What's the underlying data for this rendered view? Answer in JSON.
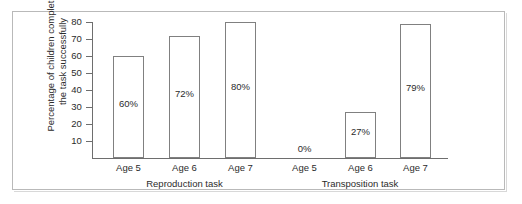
{
  "chart_data": {
    "type": "bar",
    "title": "",
    "xlabel": "",
    "ylabel": "Percentage of children completing the task successfully",
    "ylabel_lines": [
      "Percentage of children completing",
      "the task successfully"
    ],
    "ylim": [
      0,
      85
    ],
    "yticks": [
      10,
      20,
      30,
      40,
      50,
      60,
      70,
      80
    ],
    "ytick_labels": [
      "10",
      "20",
      "30",
      "40",
      "50",
      "60",
      "70",
      "80"
    ],
    "grid": false,
    "legend": "none",
    "groups": [
      {
        "name": "Reproduction task",
        "categories": [
          "Age 5",
          "Age 6",
          "Age 7"
        ],
        "values": [
          60,
          72,
          80
        ],
        "value_labels": [
          "60%",
          "72%",
          "80%"
        ]
      },
      {
        "name": "Transposition task",
        "categories": [
          "Age 5",
          "Age 6",
          "Age 7"
        ],
        "values": [
          0,
          27,
          79
        ],
        "value_labels": [
          "0%",
          "27%",
          "79%"
        ]
      }
    ],
    "colors": {
      "bar_fill": "#ffffff",
      "bar_stroke": "#808080",
      "axis": "#6e6e6e",
      "text": "#2b2b2b",
      "frame": "#b9b9b9",
      "background": "#ffffff"
    }
  },
  "bars": [
    {
      "label": "60%",
      "category": "Age 5",
      "group": "Reproduction task",
      "value": 60
    },
    {
      "label": "72%",
      "category": "Age 6",
      "group": "Reproduction task",
      "value": 72
    },
    {
      "label": "80%",
      "category": "Age 7",
      "group": "Reproduction task",
      "value": 80
    },
    {
      "label": "0%",
      "category": "Age 5",
      "group": "Transposition task",
      "value": 0
    },
    {
      "label": "27%",
      "category": "Age 6",
      "group": "Transposition task",
      "value": 27
    },
    {
      "label": "79%",
      "category": "Age 7",
      "group": "Transposition task",
      "value": 79
    }
  ]
}
